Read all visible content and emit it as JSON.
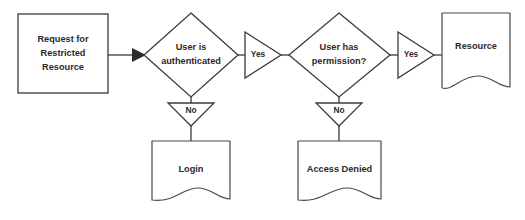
{
  "diagram": {
    "type": "flowchart",
    "background_color": "#ffffff",
    "stroke_color": "#3a3a3a",
    "text_color": "#2b2b2b",
    "nodes": {
      "request": {
        "shape": "rectangle",
        "line1": "Request for",
        "line2": "Restricted",
        "line3": "Resource"
      },
      "auth_decision": {
        "shape": "diamond",
        "line1": "User is",
        "line2": "authenticated"
      },
      "perm_decision": {
        "shape": "diamond",
        "line1": "User has",
        "line2": "permission?"
      },
      "login": {
        "shape": "document",
        "label": "Login"
      },
      "access_denied": {
        "shape": "document",
        "label": "Access Denied"
      },
      "resource": {
        "shape": "document",
        "label": "Resource"
      }
    },
    "edge_labels": {
      "auth_yes": "Yes",
      "auth_no": "No",
      "perm_yes": "Yes",
      "perm_no": "No"
    }
  }
}
